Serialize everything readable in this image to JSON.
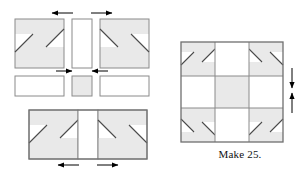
{
  "figure": {
    "type": "quilt-block-assembly-diagram",
    "caption": "Make 25.",
    "colors": {
      "patch_fill": "#e9e9e9",
      "patch_outline": "#8a8a8a",
      "seam_line": "#555555",
      "diagonal_line": "#4a4a4a",
      "background": "#ffffff",
      "arrow": "#000000",
      "text": "#111111"
    },
    "left_exploded_view": {
      "label": "exploded piecing layout",
      "top_row": {
        "left_unit": {
          "name": "corner-unit-top-left",
          "fill": "patch",
          "diagonals": 2
        },
        "middle_unit": {
          "name": "sashing-rect-vertical",
          "fill": "white"
        },
        "right_unit": {
          "name": "corner-unit-top-right",
          "fill": "patch",
          "diagonals": 2
        }
      },
      "middle_row": {
        "left_unit": {
          "name": "sashing-rect-horizontal-left",
          "fill": "white"
        },
        "middle_unit": {
          "name": "center-square",
          "fill": "patch"
        },
        "right_unit": {
          "name": "sashing-rect-horizontal-right",
          "fill": "white"
        }
      },
      "bottom_row": {
        "name": "joined-bottom-unit",
        "left_unit": {
          "name": "corner-unit-bottom-left",
          "fill": "patch",
          "diagonals": 2
        },
        "middle_unit": {
          "name": "sashing-rect-vertical-bottom",
          "fill": "white"
        },
        "right_unit": {
          "name": "corner-unit-bottom-right",
          "fill": "patch",
          "diagonals": 2
        }
      },
      "arrows": [
        {
          "name": "arrow-top-left",
          "direction": "left"
        },
        {
          "name": "arrow-top-right",
          "direction": "right"
        },
        {
          "name": "arrow-middle-left",
          "direction": "right"
        },
        {
          "name": "arrow-middle-right",
          "direction": "left"
        },
        {
          "name": "arrow-bottom-left",
          "direction": "left"
        },
        {
          "name": "arrow-bottom-right",
          "direction": "right"
        }
      ]
    },
    "right_assembled_block": {
      "label": "finished block",
      "grid": "3x3",
      "cells": [
        {
          "name": "block-cell-top-left",
          "fill": "patch",
          "diagonals": 2
        },
        {
          "name": "block-cell-top-center",
          "fill": "white"
        },
        {
          "name": "block-cell-top-right",
          "fill": "patch",
          "diagonals": 2
        },
        {
          "name": "block-cell-middle-left",
          "fill": "white"
        },
        {
          "name": "block-cell-center",
          "fill": "patch"
        },
        {
          "name": "block-cell-middle-right",
          "fill": "white"
        },
        {
          "name": "block-cell-bottom-left",
          "fill": "patch",
          "diagonals": 2
        },
        {
          "name": "block-cell-bottom-center",
          "fill": "white"
        },
        {
          "name": "block-cell-bottom-right",
          "fill": "patch",
          "diagonals": 2
        }
      ],
      "arrows": [
        {
          "name": "arrow-right-down",
          "direction": "down"
        },
        {
          "name": "arrow-right-up",
          "direction": "up"
        }
      ]
    }
  }
}
